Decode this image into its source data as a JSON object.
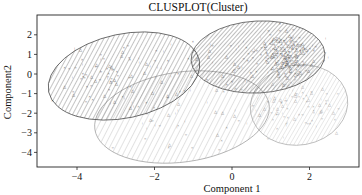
{
  "chart_data": {
    "type": "scatter",
    "title": "CLUSPLOT(Cluster)",
    "xlabel": "Component 1",
    "ylabel": "Component2",
    "xlim": [
      -5.0,
      3.3
    ],
    "ylim": [
      -4.7,
      2.9
    ],
    "x_ticks": [
      -4,
      -2,
      0,
      2
    ],
    "y_ticks": [
      2,
      1,
      0,
      -1,
      -2,
      -3,
      -4
    ],
    "grid": false,
    "legend": null,
    "clusters": [
      {
        "name": "Cluster 1",
        "center": [
          -2.8,
          -0.1
        ],
        "rx": 1.95,
        "ry": 2.2,
        "angle": -20,
        "hatch_angle": 45,
        "hatch_color": "#555555",
        "density": "medium"
      },
      {
        "name": "Cluster 2",
        "center": [
          0.7,
          0.9
        ],
        "rx": 1.75,
        "ry": 1.85,
        "angle": -5,
        "hatch_angle": 50,
        "hatch_color": "#444444",
        "density": "high"
      },
      {
        "name": "Cluster 3",
        "center": [
          -1.35,
          -2.1
        ],
        "rx": 2.3,
        "ry": 2.4,
        "angle": -15,
        "hatch_angle": 60,
        "hatch_color": "#999999",
        "density": "low"
      },
      {
        "name": "Cluster 4",
        "center": [
          1.7,
          -1.6
        ],
        "rx": 1.3,
        "ry": 2.05,
        "angle": -10,
        "hatch_angle": 55,
        "hatch_color": "#bbbbbb",
        "density": "medium"
      }
    ]
  }
}
